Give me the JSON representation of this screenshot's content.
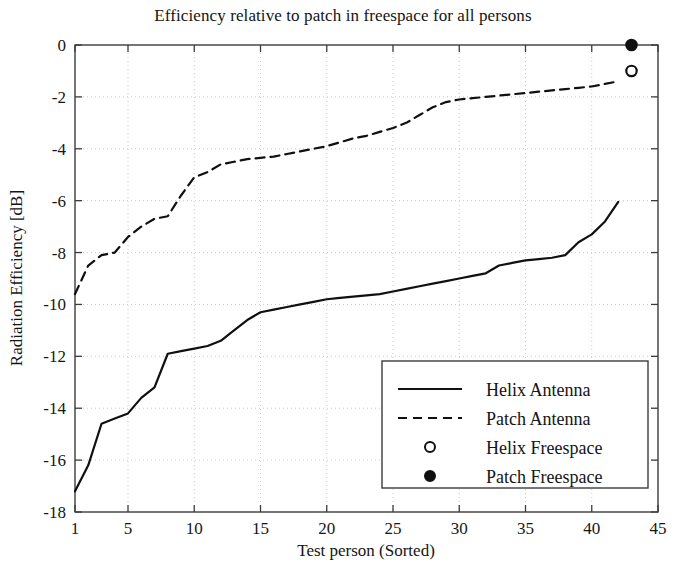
{
  "chart_data": {
    "type": "line",
    "title": "Efficiency relative to patch in freespace for all persons",
    "xlabel": "Test person (Sorted)",
    "ylabel": "Radiation Efficiency [dB]",
    "xlim": [
      1,
      45
    ],
    "ylim": [
      -18,
      0
    ],
    "xticks": [
      1,
      5,
      10,
      15,
      20,
      25,
      30,
      35,
      40,
      45
    ],
    "xtick_labels": [
      "1",
      "5",
      "10",
      "15",
      "20",
      "25",
      "30",
      "35",
      "40",
      "45"
    ],
    "yticks": [
      0,
      -2,
      -4,
      -6,
      -8,
      -10,
      -12,
      -14,
      -16,
      -18
    ],
    "ytick_labels": [
      "0",
      "-2",
      "-4",
      "-6",
      "-8",
      "-10",
      "-12",
      "-14",
      "-16",
      "-18"
    ],
    "grid": true,
    "grid_style": "dotted",
    "legend_position": "lower right",
    "series": [
      {
        "name": "Helix Antenna",
        "style": "solid",
        "color": "#101010",
        "x": [
          1,
          2,
          3,
          4,
          5,
          6,
          7,
          8,
          9,
          10,
          11,
          12,
          13,
          14,
          15,
          16,
          17,
          18,
          19,
          20,
          21,
          22,
          23,
          24,
          25,
          26,
          27,
          28,
          29,
          30,
          31,
          32,
          33,
          34,
          35,
          36,
          37,
          38,
          39,
          40,
          41,
          42
        ],
        "values": [
          -17.2,
          -16.2,
          -14.6,
          -14.4,
          -14.2,
          -13.6,
          -13.2,
          -11.9,
          -11.8,
          -11.7,
          -11.6,
          -11.4,
          -11.0,
          -10.6,
          -10.3,
          -10.2,
          -10.1,
          -10.0,
          -9.9,
          -9.8,
          -9.75,
          -9.7,
          -9.65,
          -9.6,
          -9.5,
          -9.4,
          -9.3,
          -9.2,
          -9.1,
          -9.0,
          -8.9,
          -8.8,
          -8.5,
          -8.4,
          -8.3,
          -8.25,
          -8.2,
          -8.1,
          -7.6,
          -7.3,
          -6.8,
          -6.05
        ]
      },
      {
        "name": "Patch Antenna",
        "style": "dashed",
        "color": "#101010",
        "x": [
          1,
          2,
          3,
          4,
          5,
          6,
          7,
          8,
          9,
          10,
          11,
          12,
          13,
          14,
          15,
          16,
          17,
          18,
          19,
          20,
          21,
          22,
          23,
          24,
          25,
          26,
          27,
          28,
          29,
          30,
          31,
          32,
          33,
          34,
          35,
          36,
          37,
          38,
          39,
          40,
          41,
          42
        ],
        "values": [
          -9.6,
          -8.5,
          -8.1,
          -8.0,
          -7.4,
          -7.0,
          -6.7,
          -6.6,
          -5.8,
          -5.1,
          -4.9,
          -4.6,
          -4.5,
          -4.4,
          -4.35,
          -4.3,
          -4.2,
          -4.1,
          -4.0,
          -3.9,
          -3.75,
          -3.6,
          -3.5,
          -3.35,
          -3.2,
          -3.0,
          -2.7,
          -2.4,
          -2.2,
          -2.1,
          -2.05,
          -2.0,
          -1.95,
          -1.9,
          -1.85,
          -1.8,
          -1.75,
          -1.7,
          -1.65,
          -1.6,
          -1.5,
          -1.4
        ]
      }
    ],
    "points": [
      {
        "name": "Helix Freespace",
        "marker": "open-circle",
        "color": "#101010",
        "x": 43,
        "y": -1.0
      },
      {
        "name": "Patch Freespace",
        "marker": "filled-circle",
        "color": "#101010",
        "x": 43,
        "y": 0.0
      }
    ],
    "legend": [
      {
        "label": "Helix Antenna",
        "marker": "solid-line"
      },
      {
        "label": "Patch Antenna",
        "marker": "dashed-line"
      },
      {
        "label": "Helix Freespace",
        "marker": "open-circle"
      },
      {
        "label": "Patch Freespace",
        "marker": "filled-circle"
      }
    ]
  }
}
